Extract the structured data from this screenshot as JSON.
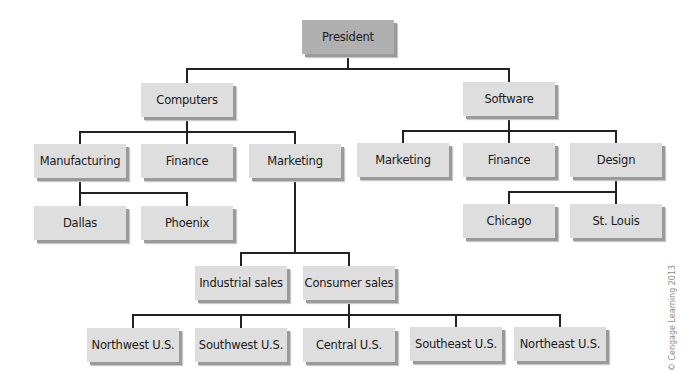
{
  "diagram": {
    "type": "org-chart",
    "nodes": [
      {
        "id": "president",
        "label": "President",
        "parent": null,
        "root": true
      },
      {
        "id": "computers",
        "label": "Computers",
        "parent": "president"
      },
      {
        "id": "software",
        "label": "Software",
        "parent": "president"
      },
      {
        "id": "comp-manufacturing",
        "label": "Manufacturing",
        "parent": "computers"
      },
      {
        "id": "comp-finance",
        "label": "Finance",
        "parent": "computers"
      },
      {
        "id": "comp-marketing",
        "label": "Marketing",
        "parent": "computers"
      },
      {
        "id": "soft-marketing",
        "label": "Marketing",
        "parent": "software"
      },
      {
        "id": "soft-finance",
        "label": "Finance",
        "parent": "software"
      },
      {
        "id": "soft-design",
        "label": "Design",
        "parent": "software"
      },
      {
        "id": "dallas",
        "label": "Dallas",
        "parent": "comp-manufacturing"
      },
      {
        "id": "phoenix",
        "label": "Phoenix",
        "parent": "comp-manufacturing"
      },
      {
        "id": "chicago",
        "label": "Chicago",
        "parent": "soft-design"
      },
      {
        "id": "st-louis",
        "label": "St. Louis",
        "parent": "soft-design"
      },
      {
        "id": "industrial-sales",
        "label": "Industrial sales",
        "parent": "comp-marketing"
      },
      {
        "id": "consumer-sales",
        "label": "Consumer sales",
        "parent": "comp-marketing"
      },
      {
        "id": "northwest",
        "label": "Northwest U.S.",
        "parent": "consumer-sales"
      },
      {
        "id": "southwest",
        "label": "Southwest U.S.",
        "parent": "consumer-sales"
      },
      {
        "id": "central",
        "label": "Central U.S.",
        "parent": "consumer-sales"
      },
      {
        "id": "southeast",
        "label": "Southeast U.S.",
        "parent": "consumer-sales"
      },
      {
        "id": "northeast",
        "label": "Northeast U.S.",
        "parent": "consumer-sales"
      }
    ]
  },
  "copyright": "© Cengage Learning 2013"
}
